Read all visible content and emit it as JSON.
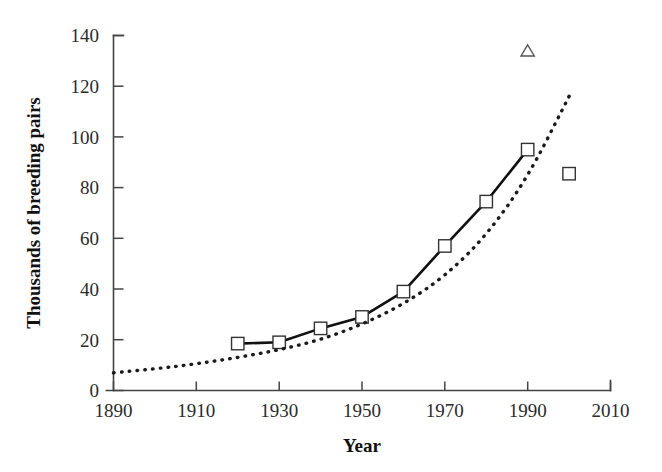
{
  "chart_data": {
    "type": "line",
    "title": "",
    "xlabel": "Year",
    "ylabel": "Thousands of breeding pairs",
    "xlim": [
      1890,
      2010
    ],
    "ylim": [
      0,
      140
    ],
    "xticks": [
      1890,
      1910,
      1930,
      1950,
      1970,
      1990,
      2010
    ],
    "yticks": [
      0,
      20,
      40,
      60,
      80,
      100,
      120,
      140
    ],
    "grid": false,
    "legend": "none",
    "series": [
      {
        "name": "observed-counts",
        "style": "solid-line-with-open-square-markers",
        "marker": "open-square",
        "x": [
          1920,
          1930,
          1940,
          1950,
          1960,
          1970,
          1980,
          1990
        ],
        "values": [
          18.5,
          19,
          24.5,
          29,
          39,
          57,
          74.5,
          95
        ]
      },
      {
        "name": "fitted-exponential-curve",
        "style": "dotted-line",
        "marker": "none",
        "x": [
          1890,
          1900,
          1910,
          1920,
          1930,
          1940,
          1950,
          1960,
          1970,
          1980,
          1990,
          2000
        ],
        "values": [
          7,
          8.5,
          10.5,
          13,
          16,
          20,
          26,
          34,
          45,
          61,
          84,
          116
        ]
      },
      {
        "name": "outlier-triangle-point",
        "style": "marker-only",
        "marker": "open-triangle",
        "x": [
          1990
        ],
        "values": [
          134
        ]
      },
      {
        "name": "final-square-point",
        "style": "marker-only",
        "marker": "open-square",
        "x": [
          2000
        ],
        "values": [
          85.5
        ]
      }
    ]
  },
  "axes": {
    "y_tick_labels": [
      "140",
      "120",
      "100",
      "80",
      "60",
      "40",
      "20",
      "0"
    ],
    "x_tick_labels": [
      "1890",
      "1910",
      "1930",
      "1950",
      "1970",
      "1990",
      "2010"
    ],
    "x_axis_title": "Year",
    "y_axis_title": "Thousands of breeding pairs"
  },
  "colors": {
    "background": "#ffffff",
    "axis": "#444444",
    "solid_series": "#101010",
    "dotted_series": "#1b1b1b",
    "marker_fill": "#ffffff",
    "marker_stroke": "#333333"
  }
}
